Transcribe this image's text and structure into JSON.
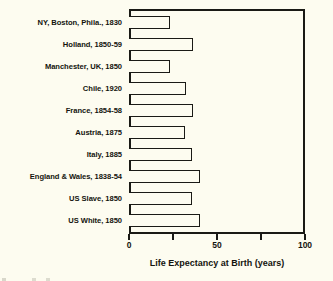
{
  "chart_data": {
    "type": "bar",
    "orientation": "horizontal",
    "title": "",
    "xlabel": "Life Expectancy at Birth (years)",
    "ylabel": "",
    "xlim": [
      0,
      100
    ],
    "xticks": [
      0,
      25,
      50,
      75,
      100
    ],
    "xtick_labels": [
      "0",
      "",
      "50",
      "",
      "100"
    ],
    "grid": false,
    "legend": "none",
    "categories": [
      "NY, Boston, Phila., 1830",
      "Holland, 1850-59",
      "Manchester, UK, 1850",
      "Chile, 1920",
      "France, 1854-58",
      "Austria, 1875",
      "Italy, 1885",
      "England & Wales, 1838-54",
      "US Slave, 1850",
      "US White, 1850"
    ],
    "values": [
      23,
      36,
      23,
      32,
      36,
      31,
      35,
      40,
      35,
      40
    ],
    "bar_fill_color": "#fdfcf0",
    "bar_edge_color": "#1a1a15",
    "background_color": "#fdfcf0"
  }
}
